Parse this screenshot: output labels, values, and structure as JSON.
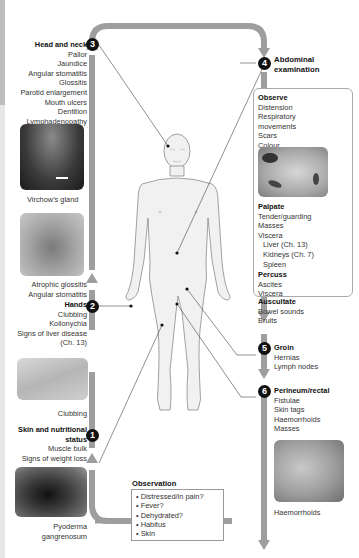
{
  "colors": {
    "arrow": "#9e9e9e",
    "badge": "#111111",
    "leader_line": "#444444",
    "edge_strip_dark": "#bdbdbd",
    "edge_strip_light": "#e6e6e6"
  },
  "steps": [
    {
      "number": "1",
      "title_lines": [
        "Skin and nutritional",
        "status"
      ],
      "items": [
        "Muscle bulk",
        "Signs of weight loss"
      ],
      "photo": {
        "caption_lines": [
          "Pyoderma",
          "gangrenosum"
        ]
      }
    },
    {
      "number": "2",
      "title": "Hands",
      "items": [
        "Clubbing",
        "Koilonychia",
        "Signs of liver disease",
        "(Ch. 13)"
      ],
      "photo": {
        "caption": "Clubbing"
      }
    },
    {
      "number": "3",
      "title": "Head and neck",
      "items": [
        "Pallor",
        "Jaundice",
        "Angular stomatitis",
        "Glossitis",
        "Parotid enlargement",
        "Mouth ulcers",
        "Dentition",
        "Lymphadenopathy"
      ],
      "photos": [
        {
          "caption": "Virchow's gland"
        },
        {
          "caption_lines": [
            "Atrophic glossitis",
            "Angular stomatitis"
          ]
        }
      ]
    },
    {
      "number": "4",
      "title_lines": [
        "Abdominal",
        "examination"
      ],
      "sections": [
        {
          "title": "Observe",
          "items": [
            "Distension",
            "Respiratory",
            "movements",
            "Scars",
            "Colour"
          ]
        },
        {
          "title": "Palpate",
          "items": [
            "Tender/guarding",
            "Masses",
            "Viscera"
          ],
          "sub_items": [
            "Liver (Ch. 13)",
            "Kidneys (Ch. 7)",
            "Spleen"
          ]
        },
        {
          "title": "Percuss",
          "items": [
            "Ascites",
            "Viscera"
          ]
        },
        {
          "title": "Auscultate",
          "items": [
            "Bowel sounds",
            "Bruits"
          ]
        }
      ]
    },
    {
      "number": "5",
      "title": "Groin",
      "items": [
        "Hernias",
        "Lymph nodes"
      ]
    },
    {
      "number": "6",
      "title": "Perineum/rectal",
      "items": [
        "Fistulae",
        "Skin tags",
        "Haemorrhoids",
        "Masses"
      ],
      "photo": {
        "caption": "Haemorrhoids"
      }
    }
  ],
  "observation": {
    "title": "Observation",
    "items": [
      "• Distressed/in pain?",
      "• Fever?",
      "• Dehydrated?",
      "• Habitus",
      "• Skin"
    ]
  },
  "figure": {
    "icon": "human-body-figure"
  }
}
